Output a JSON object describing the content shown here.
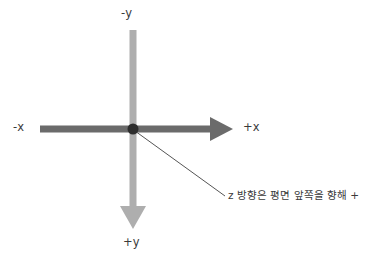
{
  "diagram": {
    "background_color": "#ffffff",
    "width": 376,
    "height": 262,
    "origin": {
      "x": 133,
      "y": 129,
      "dot_radius": 5.5,
      "dot_color": "#2e2e2e"
    },
    "axes": {
      "horizontal": {
        "name": "x-axis",
        "color": "#6b6b6b",
        "thickness": 7,
        "start_x": 40,
        "end_x": 233,
        "y": 129,
        "arrow_at": "positive-end"
      },
      "vertical": {
        "name": "y-axis",
        "color": "#aeaeae",
        "thickness": 7,
        "x": 133,
        "start_y": 30,
        "end_y": 229,
        "arrow_at": "positive-end"
      }
    },
    "leader_line": {
      "name": "z-direction-leader",
      "color": "#555555",
      "thickness": 1,
      "from_x": 135,
      "from_y": 131,
      "to_x": 225,
      "to_y": 196
    },
    "labels": {
      "negative_y": "-y",
      "negative_x": "-x",
      "positive_x": "+x",
      "positive_y": "+y",
      "z_note": "z 방향은 평면 앞쪽을 향해 +"
    },
    "colors": {
      "text": "#3a3a3a",
      "x_axis": "#6b6b6b",
      "y_axis": "#aeaeae",
      "origin_dot": "#2e2e2e",
      "leader": "#555555"
    }
  }
}
